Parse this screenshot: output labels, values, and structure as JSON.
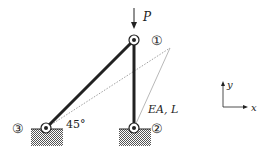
{
  "diagram": {
    "type": "two-bar truss",
    "load": {
      "label": "P",
      "direction": "down",
      "node": 1
    },
    "nodes": [
      {
        "id": 1,
        "label": "①",
        "support": "none"
      },
      {
        "id": 2,
        "label": "②",
        "support": "pinned"
      },
      {
        "id": 3,
        "label": "③",
        "support": "pinned"
      }
    ],
    "members": [
      {
        "from": 3,
        "to": 1,
        "angle_label": "45°"
      },
      {
        "from": 2,
        "to": 1,
        "property_label": "EA, L"
      }
    ],
    "deformed_shape": {
      "style": "dotted",
      "visible": true
    },
    "axes": {
      "x_label": "x",
      "y_label": "y"
    }
  },
  "colors": {
    "member": "#222222",
    "dotted": "#888888",
    "hatch": "#555555"
  }
}
